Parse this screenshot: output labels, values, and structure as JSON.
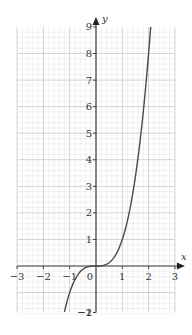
{
  "chart_data": {
    "type": "line",
    "title": "",
    "xlabel": "x",
    "ylabel": "y",
    "xlim": [
      -3,
      3
    ],
    "ylim": [
      -1.75,
      9
    ],
    "grid": true,
    "minor_grid_step": 0.2,
    "major_grid_step": 1,
    "x_ticks": [
      -3,
      -2,
      -1,
      0,
      1,
      2,
      3
    ],
    "x_tick_labels": [
      "−3",
      "−2",
      "−1",
      "0",
      "1",
      "2",
      "3"
    ],
    "y_ticks": [
      -2,
      -1,
      1,
      2,
      3,
      4,
      5,
      6,
      7,
      8,
      9
    ],
    "y_tick_labels": [
      "−2",
      "−1",
      "1",
      "2",
      "3",
      "4",
      "5",
      "6",
      "7",
      "8",
      "9"
    ],
    "series": [
      {
        "name": "y = x^3",
        "x": [
          -1.2,
          -1.0,
          -0.8,
          -0.6,
          -0.4,
          -0.2,
          0,
          0.2,
          0.4,
          0.6,
          0.8,
          1.0,
          1.2,
          1.4,
          1.6,
          1.8,
          2.0,
          2.08
        ],
        "y": [
          -1.73,
          -1.0,
          -0.51,
          -0.22,
          -0.06,
          -0.01,
          0,
          0.01,
          0.06,
          0.22,
          0.51,
          1.0,
          1.73,
          2.74,
          4.1,
          5.83,
          8.0,
          9.0
        ]
      }
    ],
    "legend": null
  },
  "colors": {
    "curve": "#4a4a4a",
    "axis": "#444444",
    "minor_grid": "#e2e2e2",
    "major_grid": "#c8c8c8",
    "background": "#ffffff"
  }
}
